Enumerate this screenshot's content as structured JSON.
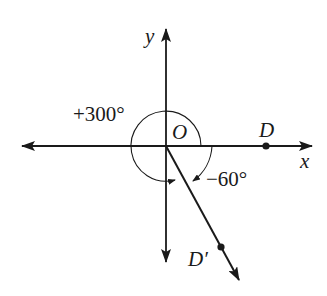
{
  "diagram": {
    "axes": {
      "x_label": "x",
      "y_label": "y",
      "origin_label": "O"
    },
    "points": [
      {
        "name": "D",
        "label": "D",
        "position": "positive x-axis"
      },
      {
        "name": "D_prime",
        "label": "D′",
        "position": "ray at -60° from positive x-axis"
      }
    ],
    "angles": [
      {
        "label": "+300°",
        "direction": "counterclockwise",
        "degrees": 300
      },
      {
        "label": "−60°",
        "direction": "clockwise",
        "degrees": -60
      }
    ],
    "colors": {
      "stroke": "#1a1a1a",
      "background": "#ffffff"
    }
  }
}
